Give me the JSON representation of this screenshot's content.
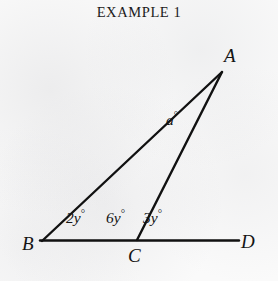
{
  "title": "EXAMPLE 1",
  "figure": {
    "background_color": "#fafafa",
    "stroke_color": "#111111",
    "vertices": {
      "A": {
        "label": "A",
        "x": 222,
        "y": 72
      },
      "B": {
        "label": "B",
        "x": 42,
        "y": 241
      },
      "C": {
        "label": "C",
        "x": 137,
        "y": 240
      },
      "D": {
        "label": "D",
        "x": 238,
        "y": 240
      }
    },
    "angles": {
      "apex": {
        "label": "a°",
        "value": "a",
        "unit": "°",
        "at_vertex": "A"
      },
      "b_angle": {
        "label": "2y°",
        "value": "2y",
        "unit": "°",
        "at_vertex": "B"
      },
      "c_interior": {
        "label": "6y°",
        "value": "6y",
        "unit": "°",
        "at_vertex": "C"
      },
      "c_exterior": {
        "label": "3y°",
        "value": "3y",
        "unit": "°",
        "at_vertex": "C"
      }
    },
    "segments": [
      {
        "name": "segment-BA",
        "from": "B",
        "to": "A"
      },
      {
        "name": "segment-AC",
        "from": "A",
        "to": "C"
      },
      {
        "name": "segment-BD",
        "from": "B",
        "to": "D"
      }
    ]
  }
}
